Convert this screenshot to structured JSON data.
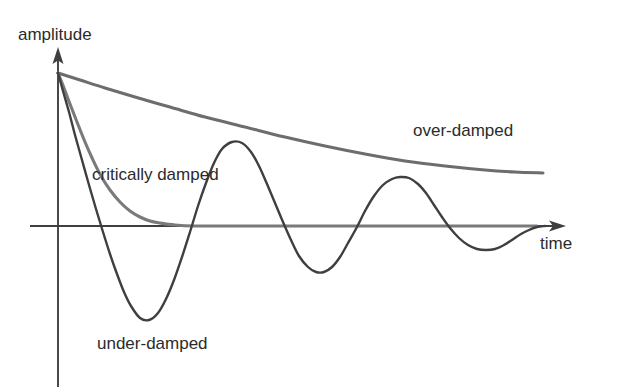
{
  "chart_data": {
    "type": "line",
    "title": "",
    "xlabel": "time",
    "ylabel": "amplitude",
    "grid": false,
    "legend_position": "inline-annotations",
    "axis_origin_px": [
      58,
      226
    ],
    "start_point_px": [
      58,
      73
    ],
    "xlim_px": [
      58,
      566
    ],
    "series": [
      {
        "name": "over-damped",
        "color": "#6d6d6d",
        "stroke_width": 3.1,
        "description": "Slow monotonic exponential decay that has not yet reached zero at the right edge of the plot.",
        "label": "over-damped",
        "label_px": [
          413,
          136
        ],
        "points_px": [
          [
            58,
            73
          ],
          [
            80,
            80
          ],
          [
            105,
            88
          ],
          [
            135,
            97
          ],
          [
            170,
            107
          ],
          [
            205,
            117
          ],
          [
            245,
            127
          ],
          [
            285,
            137
          ],
          [
            325,
            146
          ],
          [
            365,
            154
          ],
          [
            405,
            161
          ],
          [
            445,
            166
          ],
          [
            485,
            170
          ],
          [
            515,
            172
          ],
          [
            543,
            173
          ]
        ]
      },
      {
        "name": "critically damped",
        "color": "#7a7a7a",
        "stroke_width": 3.1,
        "description": "Fast monotonic decay that settles onto the zero line without overshooting.",
        "label": "critically damped",
        "label_px": [
          92,
          180
        ],
        "points_px": [
          [
            58,
            73
          ],
          [
            64,
            88
          ],
          [
            70,
            104
          ],
          [
            77,
            122
          ],
          [
            85,
            142
          ],
          [
            93,
            160
          ],
          [
            101,
            176
          ],
          [
            110,
            190
          ],
          [
            120,
            202
          ],
          [
            130,
            211
          ],
          [
            140,
            217
          ],
          [
            150,
            221
          ],
          [
            160,
            223
          ],
          [
            175,
            225
          ],
          [
            195,
            226
          ],
          [
            230,
            226
          ],
          [
            290,
            226
          ],
          [
            360,
            226
          ],
          [
            430,
            226
          ],
          [
            500,
            226
          ],
          [
            537,
            226
          ]
        ]
      },
      {
        "name": "under-damped",
        "color": "#3f3f3f",
        "stroke_width": 2.4,
        "description": "Oscillatory decay; amplitude of successive peaks shrinks exponentially toward the zero line.",
        "label": "under-damped",
        "label_px": [
          97,
          349
        ],
        "zero_crossings_px": [
          95,
          186,
          279,
          365,
          450,
          537
        ],
        "extrema_px": [
          {
            "type": "start",
            "x": 58,
            "y": 73
          },
          {
            "type": "trough",
            "x": 140,
            "y": 318
          },
          {
            "type": "peak",
            "x": 232,
            "y": 142
          },
          {
            "type": "trough",
            "x": 322,
            "y": 272
          },
          {
            "type": "peak",
            "x": 408,
            "y": 178
          },
          {
            "type": "trough",
            "x": 493,
            "y": 249
          },
          {
            "type": "end",
            "x": 545,
            "y": 227
          }
        ],
        "points_px": [
          [
            58,
            73
          ],
          [
            63,
            91
          ],
          [
            69,
            112
          ],
          [
            75,
            135
          ],
          [
            82,
            160
          ],
          [
            89,
            185
          ],
          [
            96,
            209
          ],
          [
            103,
            232
          ],
          [
            110,
            254
          ],
          [
            117,
            274
          ],
          [
            124,
            292
          ],
          [
            131,
            306
          ],
          [
            140,
            318
          ],
          [
            149,
            320
          ],
          [
            158,
            313
          ],
          [
            166,
            299
          ],
          [
            174,
            280
          ],
          [
            182,
            257
          ],
          [
            190,
            232
          ],
          [
            198,
            206
          ],
          [
            206,
            183
          ],
          [
            214,
            163
          ],
          [
            222,
            149
          ],
          [
            232,
            142
          ],
          [
            242,
            143
          ],
          [
            251,
            152
          ],
          [
            259,
            166
          ],
          [
            267,
            184
          ],
          [
            275,
            203
          ],
          [
            283,
            222
          ],
          [
            291,
            240
          ],
          [
            299,
            256
          ],
          [
            308,
            267
          ],
          [
            316,
            272
          ],
          [
            324,
            272
          ],
          [
            332,
            267
          ],
          [
            340,
            257
          ],
          [
            348,
            243
          ],
          [
            357,
            227
          ],
          [
            365,
            211
          ],
          [
            374,
            196
          ],
          [
            383,
            185
          ],
          [
            392,
            179
          ],
          [
            400,
            177
          ],
          [
            409,
            178
          ],
          [
            418,
            184
          ],
          [
            426,
            193
          ],
          [
            434,
            205
          ],
          [
            442,
            217
          ],
          [
            450,
            228
          ],
          [
            459,
            238
          ],
          [
            468,
            245
          ],
          [
            477,
            249
          ],
          [
            486,
            250
          ],
          [
            495,
            249
          ],
          [
            504,
            245
          ],
          [
            512,
            240
          ],
          [
            521,
            234
          ],
          [
            529,
            230
          ],
          [
            537,
            227
          ],
          [
            545,
            226
          ]
        ]
      }
    ],
    "annotations": [
      {
        "text": "amplitude",
        "px": [
          18,
          40
        ],
        "role": "y-axis-label"
      },
      {
        "text": "time",
        "px": [
          540,
          249
        ],
        "role": "x-axis-label"
      },
      {
        "text": "over-damped",
        "px": [
          413,
          136
        ],
        "role": "curve-label"
      },
      {
        "text": "critically damped",
        "px": [
          92,
          180
        ],
        "role": "curve-label"
      },
      {
        "text": "under-damped",
        "px": [
          97,
          349
        ],
        "role": "curve-label"
      }
    ],
    "axes": {
      "color": "#3f3f3f",
      "stroke_width": 1.8,
      "y_axis": {
        "x": 58,
        "y_top": 47,
        "y_bottom": 387,
        "arrow": "up"
      },
      "x_axis": {
        "y": 226,
        "x_left": 30,
        "x_right": 566,
        "arrow": "right"
      }
    }
  }
}
